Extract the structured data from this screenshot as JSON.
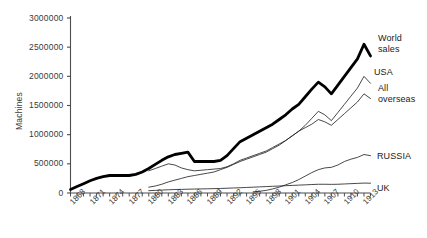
{
  "chart_data": {
    "type": "line",
    "title": "",
    "xlabel": "",
    "ylabel": "Machines",
    "xlim": [
      1868,
      1914
    ],
    "ylim": [
      0,
      3000000
    ],
    "grid": false,
    "legend_position": "right-inline-labels",
    "ytick_labels": [
      "3000000",
      "2500000",
      "2000000",
      "1500000",
      "1000000",
      "500000",
      "0"
    ],
    "ytick_values": [
      3000000,
      2500000,
      2000000,
      1500000,
      1000000,
      500000,
      0
    ],
    "xtick_labels": [
      "1868",
      "1871",
      "1874",
      "1877",
      "1880",
      "1883",
      "1886",
      "1889",
      "1892",
      "1895",
      "1898",
      "1901",
      "1904",
      "1907",
      "1910",
      "1913"
    ],
    "xtick_values": [
      1868,
      1871,
      1874,
      1877,
      1880,
      1883,
      1886,
      1889,
      1892,
      1895,
      1898,
      1901,
      1904,
      1907,
      1910,
      1913
    ],
    "minor_ticks_every_year": true,
    "x": [
      1868,
      1869,
      1870,
      1871,
      1872,
      1873,
      1874,
      1875,
      1876,
      1877,
      1878,
      1879,
      1880,
      1881,
      1882,
      1883,
      1884,
      1885,
      1886,
      1887,
      1888,
      1889,
      1890,
      1891,
      1892,
      1893,
      1894,
      1895,
      1896,
      1897,
      1898,
      1899,
      1900,
      1901,
      1902,
      1903,
      1904,
      1905,
      1906,
      1907,
      1908,
      1909,
      1910,
      1911,
      1912,
      1913,
      1914
    ],
    "series": [
      {
        "name": "World sales",
        "style": "thick-black",
        "color": "#000000",
        "width": 2.8,
        "values": [
          60000,
          110000,
          160000,
          210000,
          250000,
          280000,
          300000,
          300000,
          300000,
          300000,
          320000,
          360000,
          420000,
          490000,
          560000,
          620000,
          660000,
          680000,
          700000,
          540000,
          540000,
          540000,
          540000,
          560000,
          640000,
          760000,
          880000,
          940000,
          1000000,
          1060000,
          1120000,
          1180000,
          1260000,
          1340000,
          1440000,
          1520000,
          1650000,
          1780000,
          1900000,
          1820000,
          1700000,
          1850000,
          2000000,
          2150000,
          2300000,
          2550000,
          2350000
        ]
      },
      {
        "name": "USA",
        "style": "thin",
        "color": "#1a1a1a",
        "width": 0.8,
        "values": [
          null,
          null,
          null,
          null,
          null,
          null,
          null,
          null,
          null,
          null,
          null,
          null,
          380000,
          420000,
          460000,
          500000,
          480000,
          430000,
          400000,
          380000,
          390000,
          400000,
          410000,
          420000,
          450000,
          500000,
          560000,
          600000,
          640000,
          680000,
          720000,
          780000,
          840000,
          900000,
          980000,
          1060000,
          1160000,
          1280000,
          1400000,
          1340000,
          1240000,
          1380000,
          1520000,
          1660000,
          1800000,
          2000000,
          1880000
        ]
      },
      {
        "name": "All overseas",
        "style": "thin",
        "color": "#1a1a1a",
        "width": 0.8,
        "values": [
          null,
          null,
          null,
          null,
          null,
          null,
          null,
          null,
          null,
          null,
          null,
          null,
          100000,
          120000,
          150000,
          190000,
          220000,
          250000,
          280000,
          300000,
          320000,
          340000,
          360000,
          400000,
          440000,
          490000,
          540000,
          580000,
          620000,
          660000,
          700000,
          760000,
          820000,
          900000,
          980000,
          1060000,
          1120000,
          1180000,
          1260000,
          1220000,
          1160000,
          1260000,
          1360000,
          1460000,
          1560000,
          1700000,
          1620000
        ]
      },
      {
        "name": "RUSSIA",
        "style": "thin",
        "color": "#1a1a1a",
        "width": 0.8,
        "values": [
          null,
          null,
          null,
          null,
          null,
          null,
          null,
          null,
          null,
          null,
          null,
          null,
          null,
          null,
          null,
          null,
          null,
          null,
          null,
          null,
          null,
          null,
          null,
          null,
          null,
          null,
          null,
          null,
          20000,
          30000,
          45000,
          70000,
          100000,
          140000,
          180000,
          230000,
          290000,
          350000,
          400000,
          430000,
          440000,
          480000,
          540000,
          580000,
          610000,
          660000,
          640000
        ]
      },
      {
        "name": "UK",
        "style": "thin",
        "color": "#1a1a1a",
        "width": 0.8,
        "values": [
          null,
          null,
          null,
          null,
          null,
          null,
          null,
          null,
          null,
          null,
          null,
          null,
          40000,
          45000,
          50000,
          55000,
          60000,
          62000,
          65000,
          68000,
          70000,
          72000,
          75000,
          78000,
          82000,
          86000,
          90000,
          95000,
          100000,
          105000,
          110000,
          115000,
          120000,
          125000,
          130000,
          135000,
          140000,
          145000,
          150000,
          150000,
          148000,
          150000,
          155000,
          160000,
          165000,
          170000,
          168000
        ]
      }
    ],
    "series_labels": [
      {
        "name": "World sales",
        "lines": [
          "World",
          "sales"
        ],
        "x": 378,
        "y": 33
      },
      {
        "name": "USA",
        "lines": [
          "USA"
        ],
        "x": 374,
        "y": 67
      },
      {
        "name": "All overseas",
        "lines": [
          "All",
          "overseas"
        ],
        "x": 378,
        "y": 83
      },
      {
        "name": "RUSSIA",
        "lines": [
          "RUSSIA"
        ],
        "x": 377,
        "y": 151
      },
      {
        "name": "UK",
        "lines": [
          "UK"
        ],
        "x": 377,
        "y": 183
      }
    ]
  }
}
